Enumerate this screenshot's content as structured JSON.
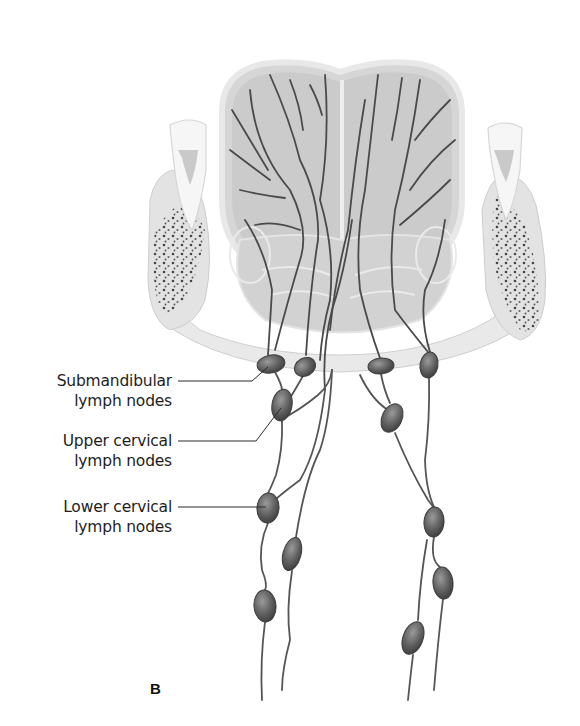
{
  "figure": {
    "panel_label": "B",
    "colors": {
      "background": "#ffffff",
      "tissue_light": "#e6e6e6",
      "tissue_mid": "#cfcfcf",
      "tissue_outline": "#bdbdbd",
      "vessel": "#4a4a4a",
      "node_fill": "#6a6a6a",
      "node_dark": "#3e3e3e",
      "leader_line": "#2a2a2a",
      "text": "#1e1e1e"
    }
  },
  "labels": [
    {
      "line1": "Submandibular",
      "line2": "lymph nodes",
      "top": 371
    },
    {
      "line1": "Upper cervical",
      "line2": "lymph nodes",
      "top": 431
    },
    {
      "line1": "Lower cervical",
      "line2": "lymph nodes",
      "top": 497
    }
  ],
  "nodes": [
    {
      "group": "submandibular",
      "side": "left",
      "cx": 271,
      "cy": 364,
      "rx": 14,
      "ry": 9,
      "rot": -10
    },
    {
      "group": "submandibular",
      "side": "left",
      "cx": 305,
      "cy": 367,
      "rx": 11,
      "ry": 9,
      "rot": -30
    },
    {
      "group": "submandibular",
      "side": "right",
      "cx": 381,
      "cy": 366,
      "rx": 13,
      "ry": 8,
      "rot": -5
    },
    {
      "group": "submandibular",
      "side": "right",
      "cx": 429,
      "cy": 365,
      "rx": 9,
      "ry": 13,
      "rot": 10
    },
    {
      "group": "upper_cervical",
      "side": "left",
      "cx": 282,
      "cy": 405,
      "rx": 10,
      "ry": 16,
      "rot": 10
    },
    {
      "group": "upper_cervical",
      "side": "right",
      "cx": 392,
      "cy": 418,
      "rx": 10,
      "ry": 15,
      "rot": 25
    },
    {
      "group": "lower_cervical",
      "side": "left",
      "cx": 268,
      "cy": 508,
      "rx": 11,
      "ry": 15,
      "rot": 5
    },
    {
      "group": "lower_cervical",
      "side": "left",
      "cx": 292,
      "cy": 554,
      "rx": 9,
      "ry": 17,
      "rot": 15
    },
    {
      "group": "lower_cervical",
      "side": "left",
      "cx": 265,
      "cy": 606,
      "rx": 11,
      "ry": 16,
      "rot": -5
    },
    {
      "group": "lower_cervical",
      "side": "right",
      "cx": 434,
      "cy": 522,
      "rx": 10,
      "ry": 15,
      "rot": 5
    },
    {
      "group": "lower_cervical",
      "side": "right",
      "cx": 443,
      "cy": 583,
      "rx": 10,
      "ry": 16,
      "rot": -5
    },
    {
      "group": "lower_cervical",
      "side": "right",
      "cx": 413,
      "cy": 638,
      "rx": 10,
      "ry": 17,
      "rot": 20
    }
  ]
}
